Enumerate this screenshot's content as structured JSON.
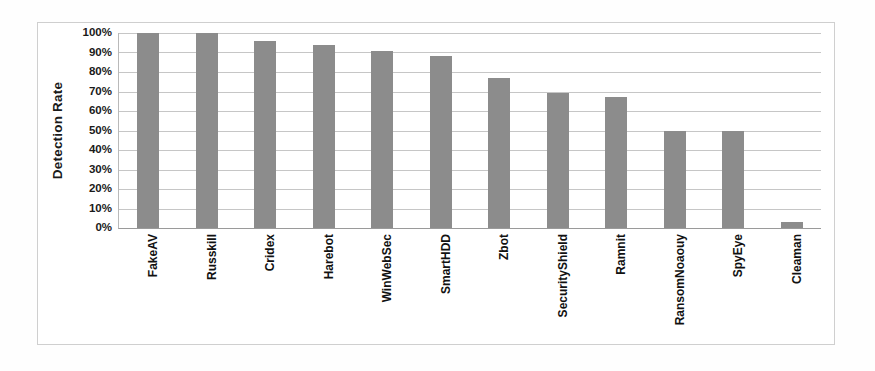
{
  "chart_data": {
    "type": "bar",
    "title": "",
    "subtitle": "",
    "xlabel": "",
    "ylabel": "Detection Rate",
    "ylim": [
      0,
      100
    ],
    "yticks": [
      "0%",
      "10%",
      "20%",
      "30%",
      "40%",
      "50%",
      "60%",
      "70%",
      "80%",
      "90%",
      "100%"
    ],
    "ytick_values": [
      0,
      10,
      20,
      30,
      40,
      50,
      60,
      70,
      80,
      90,
      100
    ],
    "grid": true,
    "legend": null,
    "legend_position": "none",
    "categories": [
      "FakeAV",
      "Russkill",
      "Cridex",
      "Harebot",
      "WinWebSec",
      "SmartHDD",
      "Zbot",
      "SecurityShield",
      "Ramnit",
      "RansomNoaouy",
      "SpyEye",
      "Cleaman"
    ],
    "values": [
      100,
      100,
      96,
      94,
      91,
      88,
      77,
      69,
      67,
      50,
      50,
      3
    ],
    "units": "percent",
    "bar_color": "#8c8c8c",
    "gridline_color": "#c6c6c6",
    "axis_color": "#9a9a9a",
    "frame_color": "#cfcfcf",
    "background_color": "#ffffff",
    "text_color": "#111111"
  }
}
